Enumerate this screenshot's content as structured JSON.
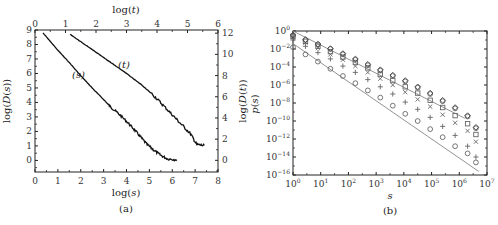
{
  "chart_data": [
    {
      "panel": "(a)",
      "type": "line",
      "caption": "(a)",
      "xlabel_bottom": "log(s)",
      "xlabel_top": "log(t)",
      "ylabel_left": "log(D(s))",
      "ylabel_right": "log(D(t))",
      "x_bottom_ticks": [
        "0",
        "1",
        "2",
        "3",
        "4",
        "5",
        "6",
        "7",
        "8"
      ],
      "x_top_ticks": [
        "0",
        "1",
        "2",
        "3",
        "4",
        "5",
        "6"
      ],
      "y_left_ticks": [
        "0",
        "1",
        "2",
        "3",
        "4",
        "5",
        "6",
        "7",
        "8",
        "9"
      ],
      "y_right_ticks": [
        "0",
        "2",
        "4",
        "6",
        "8",
        "10",
        "12"
      ],
      "xlim_bottom": [
        0,
        8
      ],
      "xlim_top": [
        0,
        6
      ],
      "ylim_left": [
        -0.8,
        9
      ],
      "ylim_right": [
        -1.1,
        12.3
      ],
      "annotations": [
        "(s)",
        "(t)"
      ],
      "series": [
        {
          "name": "(s)",
          "axis": "bottom-left",
          "x": [
            0.35,
            1.0,
            1.5,
            2.0,
            2.5,
            3.0,
            3.3,
            3.6,
            4.0,
            4.3,
            4.6,
            4.9,
            5.2,
            5.5,
            5.8,
            6.2
          ],
          "y": [
            8.8,
            7.6,
            6.75,
            5.85,
            5.0,
            4.2,
            3.7,
            3.3,
            2.7,
            2.2,
            1.65,
            1.1,
            0.7,
            0.35,
            0.1,
            0.05
          ]
        },
        {
          "name": "(t)",
          "axis": "top-right",
          "x": [
            1.15,
            1.5,
            2.0,
            2.5,
            3.0,
            3.5,
            3.9,
            4.2,
            4.5,
            4.8,
            5.1,
            5.3,
            5.55
          ],
          "y": [
            11.9,
            11.2,
            10.2,
            9.2,
            8.2,
            7.1,
            6.1,
            5.2,
            4.3,
            3.4,
            2.5,
            1.5,
            1.4
          ]
        }
      ]
    },
    {
      "panel": "(b)",
      "type": "scatter",
      "caption": "(b)",
      "xlabel": "s",
      "ylabel": "p(s)",
      "xscale": "log",
      "yscale": "log",
      "x_ticks": [
        "10^0",
        "10^1",
        "10^2",
        "10^3",
        "10^4",
        "10^5",
        "10^6",
        "10^7"
      ],
      "y_ticks": [
        "10^0",
        "10^-2",
        "10^-4",
        "10^-6",
        "10^-8",
        "10^-10",
        "10^-12",
        "10^-14",
        "10^-16"
      ],
      "xlim_log10": [
        0,
        7
      ],
      "ylim_log10": [
        -16,
        0
      ],
      "series": [
        {
          "name": "circles-lower",
          "marker": "circle",
          "x_log10": [
            0,
            0.45,
            0.9,
            1.35,
            1.8,
            2.25,
            2.7,
            3.15,
            3.6,
            4.05,
            4.5,
            4.95,
            5.4,
            5.85,
            6.3,
            6.6
          ],
          "y_log10": [
            -1.8,
            -2.6,
            -3.4,
            -4.2,
            -5.0,
            -5.8,
            -6.6,
            -7.4,
            -8.3,
            -9.2,
            -10.0,
            -10.9,
            -11.8,
            -12.8,
            -13.6,
            -14.6
          ]
        },
        {
          "name": "plus",
          "marker": "plus",
          "x_log10": [
            0,
            0.45,
            0.9,
            1.35,
            1.8,
            2.25,
            2.7,
            3.15,
            3.6,
            4.05,
            4.5,
            4.95,
            5.4,
            5.85,
            6.3,
            6.6
          ],
          "y_log10": [
            -1.0,
            -1.7,
            -2.4,
            -3.1,
            -3.9,
            -4.6,
            -5.4,
            -6.2,
            -7.0,
            -7.9,
            -8.7,
            -9.6,
            -10.6,
            -11.6,
            -12.8,
            -14.0
          ]
        },
        {
          "name": "cross",
          "marker": "x",
          "x_log10": [
            0,
            0.45,
            0.9,
            1.35,
            1.8,
            2.25,
            2.7,
            3.15,
            3.6,
            4.05,
            4.5,
            4.95,
            5.4,
            5.85,
            6.3,
            6.6
          ],
          "y_log10": [
            -0.7,
            -1.3,
            -1.9,
            -2.6,
            -3.2,
            -3.9,
            -4.6,
            -5.3,
            -6.0,
            -6.8,
            -7.6,
            -8.4,
            -9.3,
            -10.2,
            -11.1,
            -12.3
          ]
        },
        {
          "name": "squares",
          "marker": "square",
          "x_log10": [
            0,
            0.45,
            0.9,
            1.35,
            1.8,
            2.25,
            2.7,
            3.15,
            3.6,
            4.05,
            4.5,
            4.95,
            5.4,
            5.85,
            6.3,
            6.6
          ],
          "y_log10": [
            -0.6,
            -1.15,
            -1.7,
            -2.3,
            -2.9,
            -3.5,
            -4.1,
            -4.8,
            -5.5,
            -6.2,
            -6.9,
            -7.7,
            -8.5,
            -9.4,
            -10.3,
            -11.5
          ]
        },
        {
          "name": "circles-upper",
          "marker": "circle",
          "x_log10": [
            0,
            0.45,
            0.9,
            1.35,
            1.8,
            2.25,
            2.7,
            3.15,
            3.6,
            4.05,
            4.5,
            4.95,
            5.4,
            5.85,
            6.3,
            6.6
          ],
          "y_log10": [
            -0.5,
            -1.0,
            -1.5,
            -2.0,
            -2.6,
            -3.2,
            -3.8,
            -4.4,
            -5.0,
            -5.6,
            -6.3,
            -7.0,
            -7.8,
            -8.6,
            -9.5,
            -10.8
          ]
        },
        {
          "name": "diamonds",
          "marker": "diamond",
          "x_log10": [
            0,
            0.45,
            0.9,
            1.35,
            1.8,
            2.25,
            2.7,
            3.15,
            3.6,
            4.05,
            4.5,
            4.95,
            5.4,
            5.85,
            6.3,
            6.6
          ],
          "y_log10": [
            -0.45,
            -0.95,
            -1.45,
            -1.95,
            -2.5,
            -3.1,
            -3.7,
            -4.3,
            -4.9,
            -5.5,
            -6.2,
            -6.9,
            -7.7,
            -8.5,
            -9.4,
            -10.7
          ]
        }
      ],
      "reference_lines": [
        {
          "name": "upper-fit",
          "x_log10": [
            0,
            6.2
          ],
          "y_log10": [
            0.0,
            -9.7
          ]
        },
        {
          "name": "lower-fit",
          "x_log10": [
            0,
            6.7
          ],
          "y_log10": [
            -1.4,
            -15.6
          ]
        }
      ]
    }
  ],
  "panel_a": {
    "caption": "(a)",
    "xlabel_bottom": "log(s)",
    "xlabel_top": "log(",
    "xlabel_top_var": "t",
    "ylabel_left": "log(D(s))",
    "ylabel_right": "log(D(t))",
    "annotation_s": "(s)",
    "annotation_t": "(t)"
  },
  "panel_b": {
    "caption": "(b)",
    "xlabel": "s",
    "ylabel": "p(s)"
  }
}
